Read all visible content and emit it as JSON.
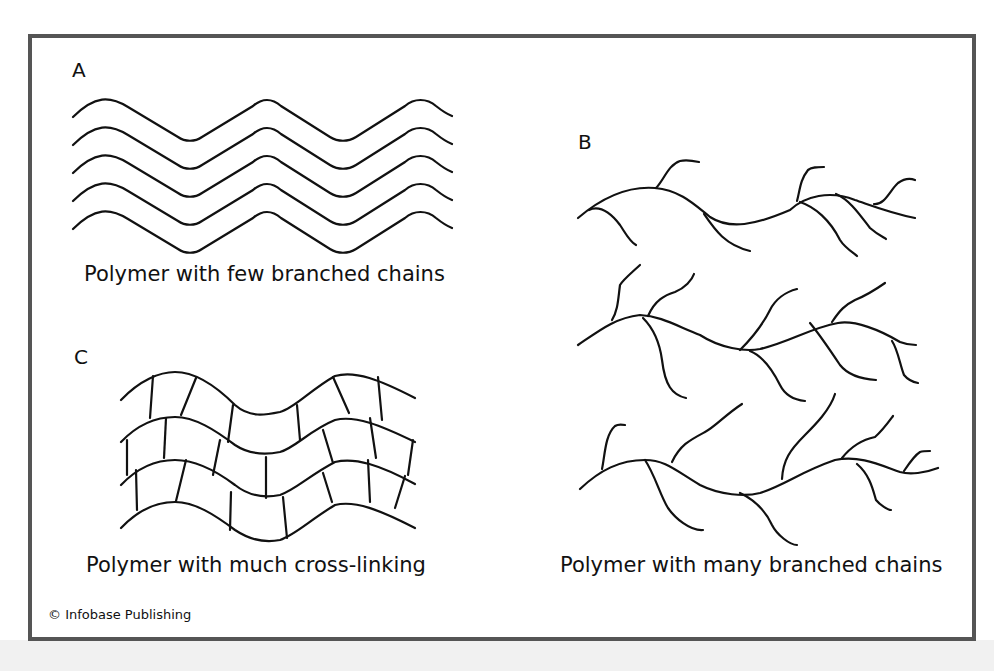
{
  "figure": {
    "panels": [
      {
        "id": "A",
        "label": "A",
        "caption": "Polymer with few branched chains"
      },
      {
        "id": "B",
        "label": "B",
        "caption": "Polymer with many branched chains"
      },
      {
        "id": "C",
        "label": "C",
        "caption": "Polymer with much cross-linking"
      }
    ],
    "credit": "© Infobase Publishing",
    "colors": {
      "frame_border": "#555555",
      "line": "#111111",
      "background": "#ffffff",
      "outer_band": "#f1f1f1"
    }
  }
}
